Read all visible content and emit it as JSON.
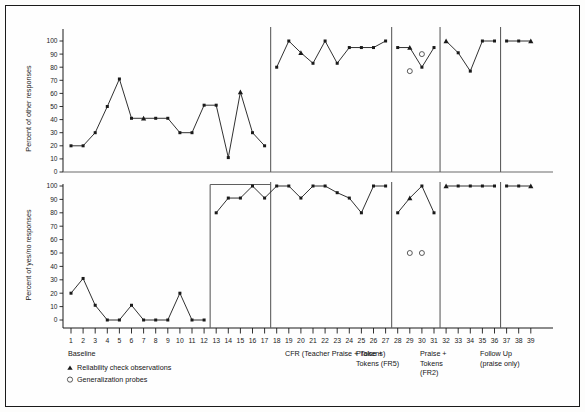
{
  "figure": {
    "background": "#fdfdfc",
    "border_color": "#1a1a1a",
    "line_color": "#1a1a1a",
    "marker_color": "#111111"
  },
  "legend": {
    "reliability_marker": "triangle",
    "reliability_label": "Reliability check observations",
    "generalization_marker": "circle-open",
    "generalization_label": "Generalization probes"
  },
  "phases": [
    {
      "key": "baseline",
      "label": "Baseline",
      "label_lines": [
        "Baseline"
      ],
      "start_session": 1,
      "end_session": 17
    },
    {
      "key": "cfr",
      "label": "CFR (Teacher Praise + Tokens)",
      "label_lines": [
        "CFR (Teacher Praise + Tokens)"
      ],
      "start_session": 18,
      "end_session": 27
    },
    {
      "key": "fr5",
      "label": "Praise + Tokens (FR5)",
      "label_lines": [
        "Praise +",
        "Tokens (FR5)"
      ],
      "start_session": 28,
      "end_session": 31
    },
    {
      "key": "fr2",
      "label": "Praise + Tokens (FR2)",
      "label_lines": [
        "Praise +",
        "Tokens",
        "(FR2)"
      ],
      "start_session": 32,
      "end_session": 36
    },
    {
      "key": "followup",
      "label": "Follow Up (praise only)",
      "label_lines": [
        "Follow Up",
        "(praise only)"
      ],
      "start_session": 37,
      "end_session": 39
    }
  ],
  "chart_data": [
    {
      "type": "line",
      "panel": "top",
      "title": "",
      "ylabel": "Percent of other responses",
      "xlabel": "",
      "ylim": [
        0,
        100
      ],
      "yticks": [
        0,
        10,
        20,
        30,
        40,
        50,
        60,
        70,
        80,
        90,
        100
      ],
      "ytick_labels": [
        "0",
        "10",
        "20",
        "30",
        "40",
        "50",
        "60",
        "70",
        "80",
        "90",
        "100"
      ],
      "xlim": [
        1,
        39
      ],
      "grid": false,
      "legend_position": "below-axes",
      "series": [
        {
          "name": "Baseline",
          "x": [
            1,
            2,
            3,
            4,
            5,
            6,
            7,
            8,
            9,
            10,
            11,
            12,
            13,
            14,
            15,
            16,
            17
          ],
          "values": [
            20,
            20,
            30,
            50,
            71,
            41,
            41,
            41,
            41,
            30,
            30,
            51,
            51,
            11,
            61,
            30,
            20
          ],
          "reliability_points": [
            7,
            15
          ],
          "generalization_points": []
        },
        {
          "name": "CFR (Teacher Praise + Tokens)",
          "x": [
            18,
            19,
            20,
            21,
            22,
            23,
            24,
            25,
            26,
            27
          ],
          "values": [
            80,
            100,
            91,
            83,
            100,
            83,
            95,
            95,
            95,
            100
          ],
          "reliability_points": [
            20
          ],
          "generalization_points": []
        },
        {
          "name": "Praise + Tokens (FR5)",
          "x": [
            28,
            29,
            30,
            31
          ],
          "values": [
            95,
            95,
            80,
            95
          ],
          "reliability_points": [
            29
          ],
          "generalization_points": [
            {
              "x": 29,
              "y": 77
            },
            {
              "x": 30,
              "y": 90
            }
          ]
        },
        {
          "name": "Praise + Tokens (FR2)",
          "x": [
            32,
            33,
            34,
            35,
            36
          ],
          "values": [
            100,
            91,
            77,
            100,
            100
          ],
          "reliability_points": [
            32
          ],
          "generalization_points": []
        },
        {
          "name": "Follow Up (praise only)",
          "x": [
            37,
            38,
            39
          ],
          "values": [
            100,
            100,
            100
          ],
          "reliability_points": [
            39
          ],
          "generalization_points": []
        }
      ]
    },
    {
      "type": "line",
      "panel": "bottom",
      "title": "",
      "ylabel": "Percent of yes/no responses",
      "xlabel": "",
      "ylim": [
        0,
        100
      ],
      "yticks": [
        0,
        10,
        20,
        30,
        40,
        50,
        60,
        70,
        80,
        90,
        100
      ],
      "ytick_labels": [
        "0",
        "10",
        "20",
        "30",
        "40",
        "50",
        "60",
        "70",
        "80",
        "90",
        "100"
      ],
      "xlim": [
        1,
        39
      ],
      "grid": false,
      "legend_position": "below-axes",
      "series": [
        {
          "name": "Baseline",
          "x": [
            1,
            2,
            3,
            4,
            5,
            6,
            7,
            8,
            9,
            10,
            11,
            12
          ],
          "values": [
            20,
            31,
            11,
            0,
            0,
            11,
            0,
            0,
            0,
            20,
            0,
            0
          ],
          "reliability_points": [],
          "generalization_points": []
        },
        {
          "name": "CFR (Teacher Praise + Tokens)",
          "x": [
            13,
            14,
            15,
            16,
            17,
            18,
            19,
            20,
            21,
            22,
            23,
            24,
            25,
            26,
            27
          ],
          "values": [
            80,
            91,
            91,
            100,
            91,
            100,
            100,
            91,
            100,
            100,
            95,
            91,
            80,
            100,
            100
          ],
          "reliability_points": [],
          "generalization_points": []
        },
        {
          "name": "Praise + Tokens (FR5)",
          "x": [
            28,
            29,
            30,
            31
          ],
          "values": [
            80,
            91,
            100,
            80
          ],
          "reliability_points": [
            29
          ],
          "generalization_points": [
            {
              "x": 29,
              "y": 50
            },
            {
              "x": 30,
              "y": 50
            }
          ]
        },
        {
          "name": "Praise + Tokens (FR2)",
          "x": [
            32,
            33,
            34,
            35,
            36
          ],
          "values": [
            100,
            100,
            100,
            100,
            100
          ],
          "reliability_points": [
            32
          ],
          "generalization_points": []
        },
        {
          "name": "Follow Up (praise only)",
          "x": [
            37,
            38,
            39
          ],
          "values": [
            100,
            100,
            100
          ],
          "reliability_points": [
            39
          ],
          "generalization_points": []
        }
      ]
    }
  ],
  "x_axis": {
    "ticks": [
      1,
      2,
      3,
      4,
      5,
      6,
      7,
      8,
      9,
      10,
      11,
      12,
      13,
      14,
      15,
      16,
      17,
      18,
      19,
      20,
      21,
      22,
      23,
      24,
      25,
      26,
      27,
      28,
      29,
      30,
      31,
      32,
      33,
      34,
      35,
      36,
      37,
      38,
      39
    ],
    "labels": [
      "1",
      "2",
      "3",
      "4",
      "5",
      "6",
      "7",
      "8",
      "9",
      "10",
      "11",
      "12",
      "13",
      "14",
      "15",
      "16",
      "17",
      "18",
      "19",
      "20",
      "21",
      "22",
      "23",
      "24",
      "25",
      "26",
      "27",
      "28",
      "29",
      "30",
      "31",
      "32",
      "33",
      "34",
      "35",
      "36",
      "37",
      "38",
      "39"
    ]
  }
}
